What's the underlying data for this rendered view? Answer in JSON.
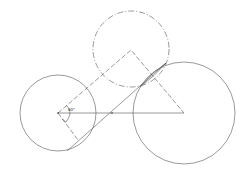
{
  "diagram": {
    "angle_label": "60°",
    "colors": {
      "stroke": "#555555",
      "background": "#ffffff"
    },
    "circles": [
      {
        "name": "left-circle",
        "cx": 58,
        "cy": 113,
        "r": 38,
        "style": "solid"
      },
      {
        "name": "top-circle",
        "cx": 131,
        "cy": 48,
        "r": 38,
        "style": "dashed"
      },
      {
        "name": "right-circle",
        "cx": 184,
        "cy": 113,
        "r": 51,
        "style": "solid"
      }
    ]
  }
}
